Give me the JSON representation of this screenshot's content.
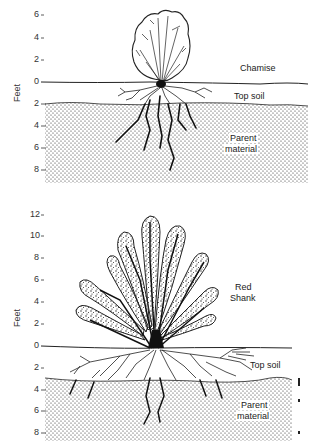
{
  "top_panel": {
    "y_axis_label": "Feet",
    "ticks_above": [
      "6",
      "4",
      "2"
    ],
    "tick_zero": "0",
    "ticks_below": [
      "2",
      "4",
      "6",
      "8"
    ],
    "plant_label": "Chamise",
    "topsoil_label": "Top soil",
    "parent_label_line1": "Parent",
    "parent_label_line2": "material"
  },
  "bottom_panel": {
    "y_axis_label": "Feet",
    "ticks_above": [
      "12",
      "10",
      "8",
      "6",
      "4",
      "2"
    ],
    "tick_zero": "0",
    "ticks_below": [
      "2",
      "4",
      "6",
      "8"
    ],
    "plant_label_line1": "Red",
    "plant_label_line2": "Shank",
    "topsoil_label": "Top soil",
    "parent_label_line1": "Parent",
    "parent_label_line2": "material"
  },
  "colors": {
    "ink": "#1a1a1a",
    "background": "#ffffff"
  }
}
